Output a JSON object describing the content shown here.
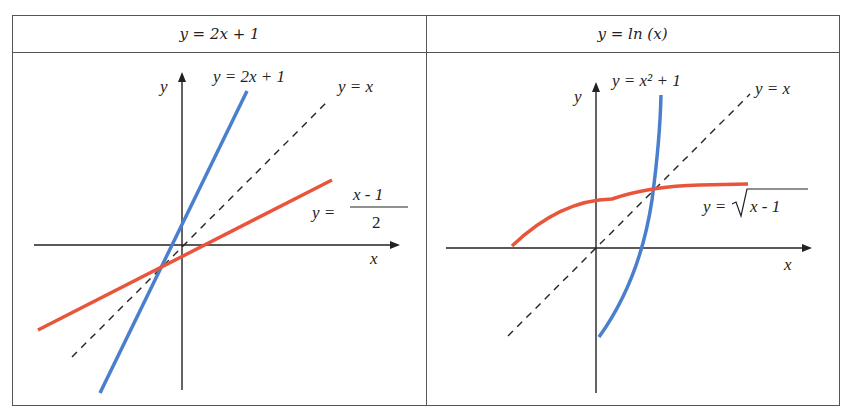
{
  "table": {
    "headers": [
      {
        "label": "y = 2x + 1"
      },
      {
        "label": "y = ln (x)"
      }
    ]
  },
  "panels": [
    {
      "id": "left",
      "axis_labels": {
        "x": "x",
        "y": "y"
      },
      "curves": [
        {
          "name": "y = 2x + 1",
          "label": "y = 2x + 1",
          "color": "#4a7fce",
          "style": "solid"
        },
        {
          "name": "y = x",
          "label": "y = x",
          "color": "#222222",
          "style": "dashed"
        },
        {
          "name": "y = (x - 1)/2",
          "label_prefix": "y =",
          "label_num": "x  - 1",
          "label_den": "2",
          "color": "#e8553a",
          "style": "solid"
        }
      ]
    },
    {
      "id": "right",
      "axis_labels": {
        "x": "x",
        "y": "y"
      },
      "curves": [
        {
          "name": "y = x^2 + 1",
          "label": "y = x² + 1",
          "color": "#4a7fce",
          "style": "solid"
        },
        {
          "name": "y = x",
          "label": "y = x",
          "color": "#222222",
          "style": "dashed"
        },
        {
          "name": "y = sqrt(x - 1)",
          "label_prefix": "y =",
          "label_radicand": "x  - 1",
          "color": "#e8553a",
          "style": "solid"
        }
      ]
    }
  ],
  "colors": {
    "blue": "#4a7fce",
    "red": "#e8553a",
    "axis": "#222222",
    "border": "#555555"
  }
}
